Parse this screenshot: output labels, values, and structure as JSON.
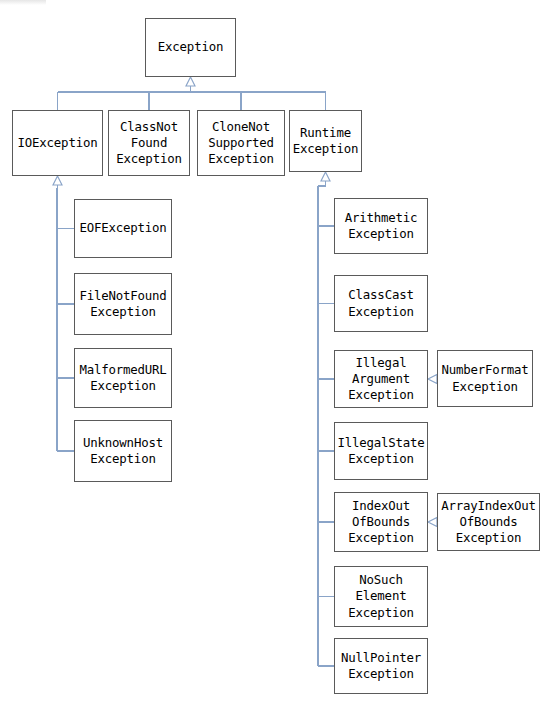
{
  "diagram": {
    "type": "uml-class-hierarchy",
    "canvas": {
      "width": 544,
      "height": 713
    },
    "colors": {
      "box_border": "#5a5a5a",
      "box_fill": "#ffffff",
      "edge": "#8aa4c8",
      "text": "#000000"
    },
    "nodes": [
      {
        "id": "exception",
        "label": "Exception",
        "x": 145,
        "y": 18,
        "w": 91,
        "h": 59
      },
      {
        "id": "ioexception",
        "label": "IOException",
        "x": 12,
        "y": 110,
        "w": 91,
        "h": 66
      },
      {
        "id": "classnotfound",
        "label": "ClassNot\nFound\nException",
        "x": 108,
        "y": 110,
        "w": 82,
        "h": 66
      },
      {
        "id": "clonenotsupported",
        "label": "CloneNot\nSupported\nException",
        "x": 197,
        "y": 110,
        "w": 88,
        "h": 66
      },
      {
        "id": "runtimeexception",
        "label": "Runtime\nException",
        "x": 289,
        "y": 110,
        "w": 73,
        "h": 62
      },
      {
        "id": "eofexception",
        "label": "EOFException",
        "x": 74,
        "y": 199,
        "w": 98,
        "h": 59
      },
      {
        "id": "filenotfound",
        "label": "FileNotFound\nException",
        "x": 74,
        "y": 273,
        "w": 98,
        "h": 62
      },
      {
        "id": "malformedurl",
        "label": "MalformedURL\nException",
        "x": 74,
        "y": 348,
        "w": 98,
        "h": 60
      },
      {
        "id": "unknownhost",
        "label": "UnknownHost\nException",
        "x": 74,
        "y": 420,
        "w": 98,
        "h": 62
      },
      {
        "id": "arithmetic",
        "label": "Arithmetic\nException",
        "x": 334,
        "y": 198,
        "w": 94,
        "h": 56
      },
      {
        "id": "classcast",
        "label": "ClassCast\nException",
        "x": 334,
        "y": 275,
        "w": 94,
        "h": 57
      },
      {
        "id": "illegalargument",
        "label": "Illegal\nArgument\nException",
        "x": 334,
        "y": 350,
        "w": 94,
        "h": 58
      },
      {
        "id": "numberformat",
        "label": "NumberFormat\nException",
        "x": 437,
        "y": 350,
        "w": 96,
        "h": 57
      },
      {
        "id": "illegalstate",
        "label": "IllegalState\nException",
        "x": 334,
        "y": 422,
        "w": 94,
        "h": 58
      },
      {
        "id": "indexoutofbounds",
        "label": "IndexOut\nOfBounds\nException",
        "x": 334,
        "y": 492,
        "w": 94,
        "h": 60
      },
      {
        "id": "arrayindexoutofbounds",
        "label": "ArrayIndexOut\nOfBounds\nException",
        "x": 437,
        "y": 493,
        "w": 103,
        "h": 58
      },
      {
        "id": "nosuchelement",
        "label": "NoSuch\nElement\nException",
        "x": 334,
        "y": 566,
        "w": 94,
        "h": 61
      },
      {
        "id": "nullpointer",
        "label": "NullPointer\nException",
        "x": 334,
        "y": 638,
        "w": 94,
        "h": 56
      }
    ],
    "edges": [
      {
        "from": "ioexception",
        "to": "exception",
        "style": "generalization"
      },
      {
        "from": "classnotfound",
        "to": "exception",
        "style": "generalization"
      },
      {
        "from": "clonenotsupported",
        "to": "exception",
        "style": "generalization"
      },
      {
        "from": "runtimeexception",
        "to": "exception",
        "style": "generalization"
      },
      {
        "from": "eofexception",
        "to": "ioexception",
        "style": "generalization"
      },
      {
        "from": "filenotfound",
        "to": "ioexception",
        "style": "generalization"
      },
      {
        "from": "malformedurl",
        "to": "ioexception",
        "style": "generalization"
      },
      {
        "from": "unknownhost",
        "to": "ioexception",
        "style": "generalization"
      },
      {
        "from": "arithmetic",
        "to": "runtimeexception",
        "style": "generalization"
      },
      {
        "from": "classcast",
        "to": "runtimeexception",
        "style": "generalization"
      },
      {
        "from": "illegalargument",
        "to": "runtimeexception",
        "style": "generalization"
      },
      {
        "from": "illegalstate",
        "to": "runtimeexception",
        "style": "generalization"
      },
      {
        "from": "indexoutofbounds",
        "to": "runtimeexception",
        "style": "generalization"
      },
      {
        "from": "nosuchelement",
        "to": "runtimeexception",
        "style": "generalization"
      },
      {
        "from": "nullpointer",
        "to": "runtimeexception",
        "style": "generalization"
      },
      {
        "from": "numberformat",
        "to": "illegalargument",
        "style": "generalization"
      },
      {
        "from": "arrayindexoutofbounds",
        "to": "indexoutofbounds",
        "style": "generalization"
      }
    ]
  }
}
